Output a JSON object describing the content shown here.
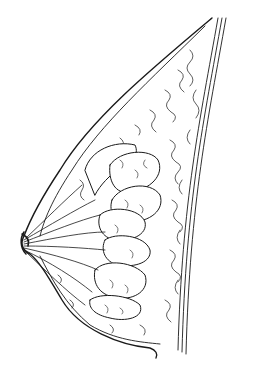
{
  "illustration": {
    "subject": "anatomical line drawing",
    "style": "black ink on white",
    "colors": {
      "background": "#ffffff",
      "ink": "#1a1a1a",
      "fill": "#ffffff"
    },
    "regions": [
      "outer-contour",
      "chest-wall-lines",
      "fatty-tissue",
      "lobules",
      "ducts",
      "nipple"
    ]
  }
}
